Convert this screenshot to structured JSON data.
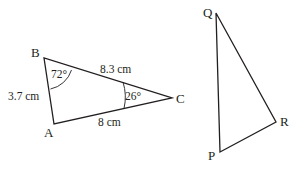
{
  "diagram": {
    "triangle_abc": {
      "vertices": {
        "A": "A",
        "B": "B",
        "C": "C"
      },
      "sides": {
        "AB": "3.7 cm",
        "BC": "8.3 cm",
        "AC": "8 cm"
      },
      "angles": {
        "B": "72°",
        "C": "26°"
      }
    },
    "triangle_pqr": {
      "vertices": {
        "P": "P",
        "Q": "Q",
        "R": "R"
      }
    },
    "colors": {
      "stroke": "#231f20",
      "background": "#ffffff"
    }
  }
}
